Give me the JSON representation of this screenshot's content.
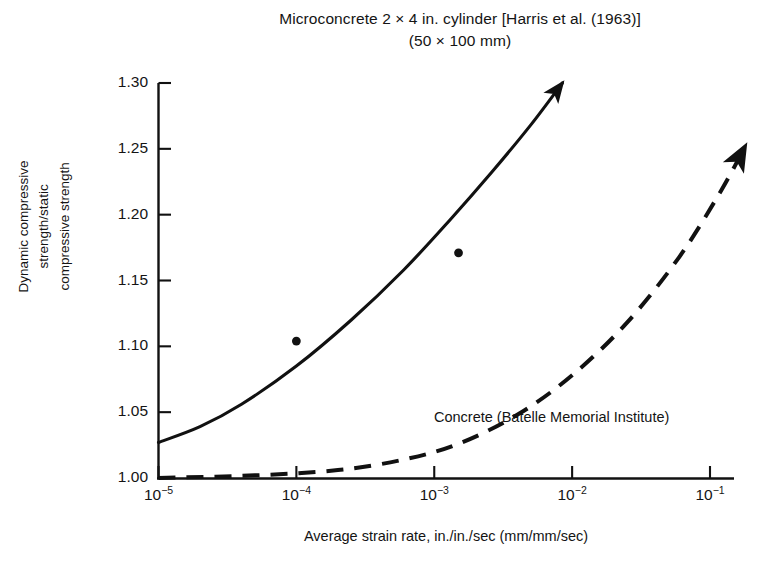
{
  "chart_data": {
    "type": "line",
    "title": "Microconcrete 2 × 4 in. cylinder [Harris et al. (1963)]",
    "subtitle": "(50 × 100 mm)",
    "xlabel": "Average strain rate, in./in./sec (mm/mm/sec)",
    "ylabel_lines": [
      "Dynamic compressive",
      "strength/static",
      "compressive strength"
    ],
    "xscale": "log",
    "yscale": "linear",
    "xlim": [
      1e-05,
      0.17
    ],
    "ylim": [
      1.0,
      1.3
    ],
    "grid": false,
    "legend": "inline annotations",
    "xticks": [
      {
        "value": 1e-05,
        "label": "10",
        "exponent": "−5"
      },
      {
        "value": 0.0001,
        "label": "10",
        "exponent": "−4"
      },
      {
        "value": 0.001,
        "label": "10",
        "exponent": "−3"
      },
      {
        "value": 0.01,
        "label": "10",
        "exponent": "−2"
      },
      {
        "value": 0.1,
        "label": "10",
        "exponent": "−1"
      }
    ],
    "yticks": [
      {
        "value": 1.3,
        "label": "1.30"
      },
      {
        "value": 1.25,
        "label": "1.25"
      },
      {
        "value": 1.2,
        "label": "1.20"
      },
      {
        "value": 1.15,
        "label": "1.15"
      },
      {
        "value": 1.1,
        "label": "1.10"
      },
      {
        "value": 1.05,
        "label": "1.05"
      },
      {
        "value": 1.0,
        "label": "1.00"
      }
    ],
    "series": [
      {
        "name": "Microconcrete 2 × 4 in. cylinder [Harris et al. (1963)]",
        "style": "solid",
        "color": "#111111",
        "arrow_end": true,
        "points": [
          {
            "x": 1e-05,
            "y": 1.027
          },
          {
            "x": 2e-05,
            "y": 1.039
          },
          {
            "x": 4e-05,
            "y": 1.056
          },
          {
            "x": 0.0001,
            "y": 1.085
          },
          {
            "x": 0.00025,
            "y": 1.12
          },
          {
            "x": 0.0006,
            "y": 1.158
          },
          {
            "x": 0.0013,
            "y": 1.196
          },
          {
            "x": 0.0026,
            "y": 1.232
          },
          {
            "x": 0.005,
            "y": 1.268
          },
          {
            "x": 0.0085,
            "y": 1.3
          }
        ]
      },
      {
        "name": "Concrete (Batelle Memorial Institute)",
        "style": "dashed",
        "color": "#111111",
        "arrow_end": true,
        "points": [
          {
            "x": 1e-05,
            "y": 1.0
          },
          {
            "x": 5e-05,
            "y": 1.002
          },
          {
            "x": 0.0002,
            "y": 1.006
          },
          {
            "x": 0.0006,
            "y": 1.014
          },
          {
            "x": 0.0015,
            "y": 1.026
          },
          {
            "x": 0.004,
            "y": 1.048
          },
          {
            "x": 0.01,
            "y": 1.078
          },
          {
            "x": 0.025,
            "y": 1.118
          },
          {
            "x": 0.06,
            "y": 1.168
          },
          {
            "x": 0.12,
            "y": 1.218
          },
          {
            "x": 0.18,
            "y": 1.252
          }
        ]
      }
    ],
    "scatter_points": [
      {
        "x": 0.0001,
        "y": 1.104,
        "series": "Microconcrete 2 × 4 in. cylinder [Harris et al. (1963)]"
      },
      {
        "x": 0.0015,
        "y": 1.171,
        "series": "Microconcrete 2 × 4 in. cylinder [Harris et al. (1963)]"
      }
    ],
    "annotations": [
      {
        "text": "Concrete (Batelle Memorial Institute)",
        "x": 0.002,
        "y": 1.044
      }
    ]
  }
}
